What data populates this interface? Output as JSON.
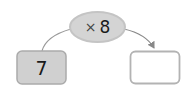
{
  "diagram": {
    "type": "function-machine",
    "operation": {
      "symbol": "×",
      "operand": "8"
    },
    "input": {
      "value": "7"
    },
    "output": {
      "value": ""
    },
    "colors": {
      "ellipse_fill": "#d4d4d4",
      "ellipse_stroke": "#c2c2c2",
      "input_fill": "#d0d0d0",
      "input_stroke": "#a8a8a8",
      "output_fill": "#ffffff",
      "output_stroke": "#b0b0b0",
      "arrow": "#888888"
    }
  }
}
